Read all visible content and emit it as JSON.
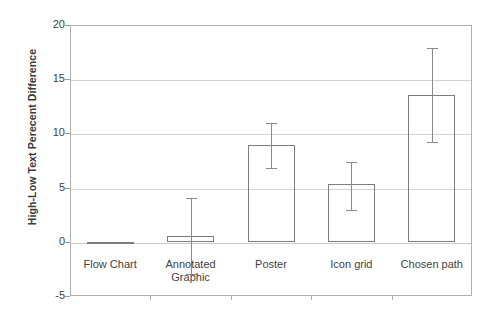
{
  "chart_data": {
    "type": "bar",
    "title": "",
    "xlabel": "",
    "ylabel": "High-Low Text Perecent Difference",
    "categories": [
      "Flow Chart",
      "Annotated Graphic",
      "Poster",
      "Icon grid",
      "Chosen path"
    ],
    "category_lines": [
      [
        "Flow Chart"
      ],
      [
        "Annotated",
        "Graphic"
      ],
      [
        "Poster"
      ],
      [
        "Icon grid"
      ],
      [
        "Chosen path"
      ]
    ],
    "values": [
      -0.1,
      0.5,
      8.9,
      5.3,
      13.5
    ],
    "error_high": [
      -0.1,
      4.0,
      11.0,
      7.4,
      17.9
    ],
    "error_low": [
      -0.1,
      -3.0,
      6.8,
      2.9,
      9.2
    ],
    "ylim": [
      -5,
      20
    ],
    "yticks": [
      20,
      15,
      10,
      5,
      0,
      -5
    ],
    "ytick_labels": [
      "20",
      "15",
      "10",
      "5",
      "0",
      "-5"
    ],
    "grid": true,
    "grid_axis": "y",
    "legend": null,
    "bar_facecolor": "#ffffff",
    "bar_edgecolor": "#7d7d7d",
    "errorbar_color": "#8a8a8a",
    "gridline_color": "#d4d4d4",
    "axis_color": "#b0b0b0",
    "text_color": "#3f3f3f"
  }
}
